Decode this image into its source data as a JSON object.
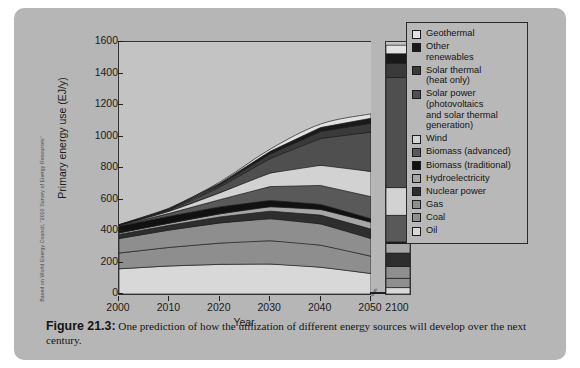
{
  "credit": "Based on World Energy Council, \"2010 Survey of Energy Resources\"",
  "caption": {
    "figure_number": "Figure 21.3:",
    "text": " One prediction of how the utilization of different energy sources will develop over the next century."
  },
  "chart_data": {
    "type": "area",
    "title": "",
    "xlabel": "Year",
    "ylabel": "Primary energy use (EJ/y)",
    "ylim": [
      0,
      1600
    ],
    "xlim": [
      2000,
      2050
    ],
    "yticks": [
      0,
      200,
      400,
      600,
      800,
      1000,
      1200,
      1400,
      1600
    ],
    "xticks": [
      2000,
      2010,
      2020,
      2030,
      2040,
      2050
    ],
    "break_marker": "⫽",
    "extra_column": {
      "label": "2100",
      "total": 1580
    },
    "grid": false,
    "legend_position": "right",
    "stack_order_bottom_to_top": [
      "Oil",
      "Coal",
      "Gas",
      "Nuclear power",
      "Hydroelectricity",
      "Biomass (traditional)",
      "Biomass (advanced)",
      "Wind",
      "Solar power (photovoltaics and solar thermal generation)",
      "Solar thermal (heat only)",
      "Other renewables",
      "Geothermal"
    ],
    "x": [
      2000,
      2010,
      2020,
      2030,
      2040,
      2050
    ],
    "series": [
      {
        "name": "Oil",
        "color": "#d8d8d8",
        "values": [
          160,
          178,
          188,
          190,
          170,
          130
        ]
      },
      {
        "name": "Coal",
        "color": "#8e8e8e",
        "values": [
          100,
          118,
          135,
          148,
          140,
          110
        ]
      },
      {
        "name": "Gas",
        "color": "#8e8e8e",
        "values": [
          92,
          110,
          128,
          140,
          135,
          112
        ]
      },
      {
        "name": "Nuclear power",
        "color": "#2e2e2e",
        "values": [
          26,
          30,
          38,
          48,
          56,
          60
        ]
      },
      {
        "name": "Hydroelectricity",
        "color": "#a6a6a6",
        "values": [
          10,
          14,
          20,
          28,
          36,
          44
        ]
      },
      {
        "name": "Biomass (traditional)",
        "color": "#111111",
        "values": [
          42,
          44,
          44,
          40,
          32,
          22
        ]
      },
      {
        "name": "Biomass (advanced)",
        "color": "#595959",
        "values": [
          4,
          18,
          46,
          88,
          120,
          140
        ]
      },
      {
        "name": "Wind",
        "color": "#d2d2d2",
        "values": [
          2,
          14,
          44,
          86,
          128,
          160
        ]
      },
      {
        "name": "Solar power (photovoltaics and solar thermal generation)",
        "color": "#4f4f4f",
        "values": [
          1,
          8,
          36,
          92,
          170,
          250
        ]
      },
      {
        "name": "Solar thermal (heat only)",
        "color": "#3a3a3a",
        "values": [
          1,
          5,
          14,
          28,
          44,
          56
        ]
      },
      {
        "name": "Other renewables",
        "color": "#1a1a1a",
        "values": [
          1,
          4,
          10,
          18,
          26,
          32
        ]
      },
      {
        "name": "Geothermal",
        "color": "#e2e2e2",
        "values": [
          1,
          3,
          8,
          14,
          22,
          28
        ]
      }
    ],
    "column_2100_values": {
      "Oil": 40,
      "Coal": 60,
      "Gas": 75,
      "Nuclear power": 85,
      "Hydroelectricity": 60,
      "Biomass (traditional)": 10,
      "Biomass (advanced)": 170,
      "Wind": 175,
      "Solar power (photovoltaics and solar thermal generation)": 700,
      "Solar thermal (heat only)": 90,
      "Other renewables": 60,
      "Geothermal": 55
    }
  },
  "legend": {
    "items": [
      {
        "label": "Geothermal",
        "color": "#e2e2e2"
      },
      {
        "label": "Other\nrenewables",
        "color": "#1a1a1a"
      },
      {
        "label": "Solar thermal\n(heat only)",
        "color": "#3a3a3a"
      },
      {
        "label": "Solar power\n(photovoltaics\nand solar thermal\ngeneration)",
        "color": "#4f4f4f"
      },
      {
        "label": "Wind",
        "color": "#d2d2d2"
      },
      {
        "label": "Biomass (advanced)",
        "color": "#595959"
      },
      {
        "label": "Biomass (traditional)",
        "color": "#111111"
      },
      {
        "label": "Hydroelectricity",
        "color": "#a6a6a6"
      },
      {
        "label": "Nuclear power",
        "color": "#2e2e2e"
      },
      {
        "label": "Gas",
        "color": "#8e8e8e"
      },
      {
        "label": "Coal",
        "color": "#8e8e8e"
      },
      {
        "label": "Oil",
        "color": "#d8d8d8"
      }
    ]
  }
}
